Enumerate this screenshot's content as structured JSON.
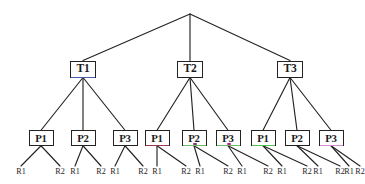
{
  "diagram": {
    "type": "tree",
    "background_color": "#ffffff",
    "line_color": "#232323",
    "text_color": "#1a1a1a",
    "levels": 4,
    "root": {
      "label": "",
      "x": 190,
      "y": 14
    },
    "tier_nodes": [
      {
        "label": "T1",
        "x": 83,
        "y": 69,
        "border_color": "#232323",
        "accent_color": "#4a5fa8",
        "accent_type": "underline"
      },
      {
        "label": "T2",
        "x": 190,
        "y": 69,
        "border_color": "#232323",
        "accent_color": "",
        "accent_type": "none"
      },
      {
        "label": "T3",
        "x": 290,
        "y": 69,
        "border_color": "#232323",
        "accent_color": "",
        "accent_type": "none"
      }
    ],
    "process_nodes": [
      {
        "label": "P1",
        "x": 41,
        "y": 138,
        "parent": "T1",
        "accent_color": "",
        "accent_type": "none",
        "dot_color": ""
      },
      {
        "label": "P2",
        "x": 83,
        "y": 138,
        "parent": "T1",
        "accent_color": "",
        "accent_type": "none",
        "dot_color": ""
      },
      {
        "label": "P3",
        "x": 125,
        "y": 138,
        "parent": "T1",
        "accent_color": "",
        "accent_type": "none",
        "dot_color": ""
      },
      {
        "label": "P1",
        "x": 157,
        "y": 138,
        "parent": "T2",
        "accent_color": "#9a3b52",
        "accent_type": "underline",
        "dot_color": ""
      },
      {
        "label": "P2",
        "x": 194,
        "y": 138,
        "parent": "T2",
        "accent_color": "#6bbf6b",
        "accent_type": "underline",
        "dot_color": "#8a2f7a"
      },
      {
        "label": "P3",
        "x": 228,
        "y": 138,
        "parent": "T2",
        "accent_color": "#6bbf6b",
        "accent_type": "underline",
        "dot_color": "#c2179c"
      },
      {
        "label": "P1",
        "x": 263,
        "y": 138,
        "parent": "T3",
        "accent_color": "#4fc24f",
        "accent_type": "underline",
        "dot_color": ""
      },
      {
        "label": "P2",
        "x": 297,
        "y": 138,
        "parent": "T3",
        "accent_color": "",
        "accent_type": "none",
        "dot_color": ""
      },
      {
        "label": "P3",
        "x": 331,
        "y": 138,
        "parent": "T3",
        "accent_color": "#d68ad0",
        "accent_type": "underline",
        "dot_color": ""
      }
    ],
    "leaf_nodes": [
      {
        "label": "R1",
        "x": 21,
        "y": 173,
        "parent_index": 0
      },
      {
        "label": "R2",
        "x": 60,
        "y": 173,
        "parent_index": 0
      },
      {
        "label": "R1",
        "x": 75,
        "y": 173,
        "parent_index": 1
      },
      {
        "label": "R2",
        "x": 101,
        "y": 173,
        "parent_index": 1
      },
      {
        "label": "R1",
        "x": 115,
        "y": 173,
        "parent_index": 2
      },
      {
        "label": "R2",
        "x": 143,
        "y": 173,
        "parent_index": 2
      },
      {
        "label": "R1",
        "x": 157,
        "y": 173,
        "parent_index": 3
      },
      {
        "label": "R2",
        "x": 186,
        "y": 173,
        "parent_index": 3
      },
      {
        "label": "R1",
        "x": 200,
        "y": 173,
        "parent_index": 4
      },
      {
        "label": "R2",
        "x": 228,
        "y": 173,
        "parent_index": 4
      },
      {
        "label": "R1",
        "x": 242,
        "y": 173,
        "parent_index": 5
      },
      {
        "label": "R2",
        "x": 268,
        "y": 173,
        "parent_index": 5
      },
      {
        "label": "R1",
        "x": 282,
        "y": 173,
        "parent_index": 6
      },
      {
        "label": "R2",
        "x": 307,
        "y": 173,
        "parent_index": 6
      },
      {
        "label": "R1",
        "x": 318,
        "y": 173,
        "parent_index": 7
      },
      {
        "label": "R2",
        "x": 340,
        "y": 173,
        "parent_index": 7
      },
      {
        "label": "R1",
        "x": 349,
        "y": 173,
        "parent_index": 8
      },
      {
        "label": "R2",
        "x": 360,
        "y": 173,
        "parent_index": 8
      }
    ]
  }
}
